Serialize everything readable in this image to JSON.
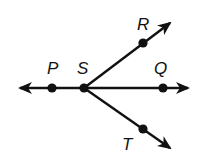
{
  "diagram": {
    "type": "geometry-rays",
    "stroke_color": "#111111",
    "background": "#ffffff",
    "line": {
      "name": "line PQ",
      "from": [
        18,
        88
      ],
      "to": [
        190,
        88
      ],
      "arrow_both_ends": true
    },
    "rays": [
      {
        "name": "ray SR",
        "from": [
          84,
          88
        ],
        "to": [
          172,
          22
        ]
      },
      {
        "name": "ray ST",
        "from": [
          84,
          88
        ],
        "to": [
          172,
          149
        ]
      }
    ],
    "points": [
      {
        "id": "P",
        "label": "P",
        "x": 52,
        "y": 88,
        "label_x": 49,
        "label_y": 73
      },
      {
        "id": "S",
        "label": "S",
        "x": 84,
        "y": 88,
        "label_x": 78,
        "label_y": 73
      },
      {
        "id": "Q",
        "label": "Q",
        "x": 163,
        "y": 88,
        "label_x": 155,
        "label_y": 73
      },
      {
        "id": "R",
        "label": "R",
        "x": 143,
        "y": 43,
        "label_x": 137,
        "label_y": 30
      },
      {
        "id": "T",
        "label": "T",
        "x": 143,
        "y": 129,
        "label_x": 123,
        "label_y": 150
      }
    ]
  }
}
